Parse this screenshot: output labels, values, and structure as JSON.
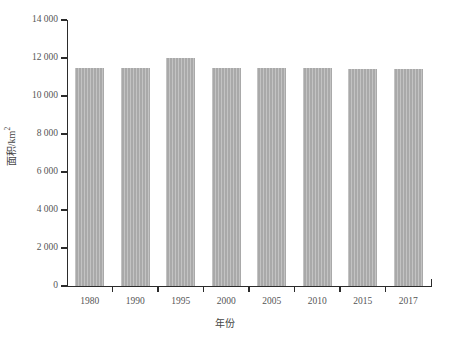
{
  "chart_data": {
    "type": "bar",
    "title": "",
    "subtitle": "",
    "xlabel": "年份",
    "ylabel": "面积/km2",
    "ylabel_base": "面积/km",
    "ylabel_exponent": "2",
    "categories": [
      "1980",
      "1990",
      "1995",
      "2000",
      "2005",
      "2010",
      "2015",
      "2017"
    ],
    "values": [
      11500,
      11500,
      12000,
      11480,
      11480,
      11480,
      11430,
      11420
    ],
    "series": [
      {
        "name": "面积",
        "values": [
          11500,
          11500,
          12000,
          11480,
          11480,
          11480,
          11430,
          11420
        ]
      }
    ],
    "ylim": [
      0,
      14000
    ],
    "ytick_values": [
      0,
      2000,
      4000,
      6000,
      8000,
      10000,
      12000,
      14000
    ],
    "ytick_labels": [
      "0",
      "2 000",
      "4 000",
      "6 000",
      "8 000",
      "10 000",
      "12 000",
      "14 000"
    ],
    "xtick_labels": [
      "1980",
      "1990",
      "1995",
      "2000",
      "2005",
      "2010",
      "2015",
      "2017"
    ],
    "grid": false,
    "legend": null,
    "legend_position": "none",
    "bar_color": "#a9a9a9",
    "axis_color": "#2b2b2b",
    "text_color": "#555555",
    "annotations": []
  }
}
